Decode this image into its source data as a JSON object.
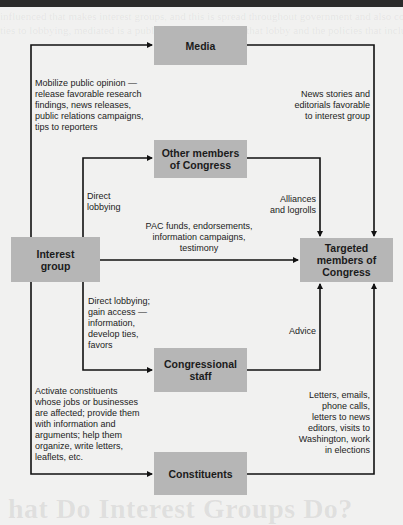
{
  "diagram": {
    "title": "",
    "nodes": {
      "media": "Media",
      "other_members": "Other members\nof Congress",
      "interest_group": "Interest\ngroup",
      "targeted_members": "Targeted\nmembers of\nCongress",
      "congressional_staff": "Congressional\nstaff",
      "constituents": "Constituents"
    },
    "edges": {
      "interest_to_media": "Mobilize public opinion —\nrelease favorable research\nfindings, news releases,\npublic relations campaigns,\ntips to reporters",
      "media_to_targeted": "News stories and\neditorials favorable\nto interest group",
      "interest_to_other_members": "Direct\nlobbying",
      "other_members_to_targeted": "Alliances\nand logrolls",
      "interest_to_targeted": "PAC funds, endorsements,\ninformation campaigns,\ntestimony",
      "interest_to_staff": "Direct lobbying;\ngain access —\ninformation,\ndevelop ties,\nfavors",
      "staff_to_targeted": "Advice",
      "interest_to_constituents": "Activate constituents\nwhose jobs or businesses\nare affected; provide them\nwith information and\narguments; help them\norganize, write letters,\nleaflets, etc.",
      "constituents_to_targeted": "Letters, emails,\nphone calls,\nletters to news\neditors, visits to\nWashington, work\nin elections"
    },
    "colors": {
      "box_fill": "#b6b6b6",
      "line": "#111111",
      "background": "#f1f1f0"
    }
  },
  "page_bleed": {
    "top_line_1": "influenced that makes interest groups, and this is spread throughout government and also coverage",
    "top_line_2": "ties to lobbying, mediated is a public relations outcome that lobby and the policies that include",
    "bottom_heading": "hat Do Interest Groups Do?"
  }
}
